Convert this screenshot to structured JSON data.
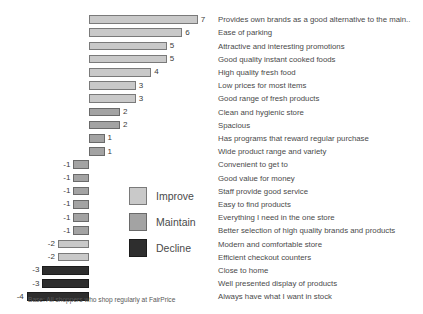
{
  "chart_data": {
    "type": "bar",
    "title": "",
    "subtitle": "",
    "xlabel": "",
    "ylabel": "",
    "orientation": "horizontal",
    "grid": false,
    "zero_baseline": true,
    "xlim": [
      -4,
      7
    ],
    "legend_position": "center-left",
    "categories": [
      "Provides own brands as a good alternative to the main..",
      "Ease of parking",
      "Attractive and interesting promotions",
      "Good quality instant cooked foods",
      "High quality fresh food",
      "Low prices for most items",
      "Good range of fresh products",
      "Clean and hygienic store",
      "Spacious",
      "Has programs that reward regular purchase",
      "Wide product range and variety",
      "Convenient to get to",
      "Good value for money",
      "Staff provide good service",
      "Easy to find products",
      "Everything I need in the one store",
      "Better selection of high quality brands and products",
      "Modern and comfortable store",
      "Efficient checkout counters",
      "Close to home",
      "Well presented display of products",
      "Always have what I want in stock"
    ],
    "values": [
      7,
      6,
      5,
      5,
      4,
      3,
      3,
      2,
      2,
      1,
      1,
      -1,
      -1,
      -1,
      -1,
      -1,
      -1,
      -2,
      -2,
      -3,
      -3,
      -4
    ],
    "value_labels": [
      "7",
      "6",
      "5",
      "5",
      "4",
      "3",
      "3",
      "2",
      "2",
      "1",
      "1",
      "-1",
      "-1",
      "-1",
      "-1",
      "-1",
      "-1",
      "-2",
      "-2",
      "-3",
      "-3",
      "-4"
    ],
    "series_groups": [
      "improve",
      "improve",
      "improve",
      "improve",
      "improve",
      "improve",
      "improve",
      "maintain",
      "maintain",
      "maintain",
      "maintain",
      "maintain",
      "maintain",
      "maintain",
      "maintain",
      "maintain",
      "maintain",
      "improve",
      "improve",
      "decline",
      "decline",
      "decline"
    ],
    "legend": [
      {
        "key": "improve",
        "label": "Improve",
        "color": "#c9c9c9"
      },
      {
        "key": "maintain",
        "label": "Maintain",
        "color": "#a3a3a3"
      },
      {
        "key": "decline",
        "label": "Decline",
        "color": "#2e2e2e"
      }
    ]
  },
  "footnote": {
    "text": "Base: All shoppers who shop regularly at FairPrice"
  },
  "colors": {
    "background": "#ffffff",
    "improve": "#c9c9c9",
    "maintain": "#a3a3a3",
    "decline": "#2e2e2e",
    "text": "#4a4a4a"
  }
}
